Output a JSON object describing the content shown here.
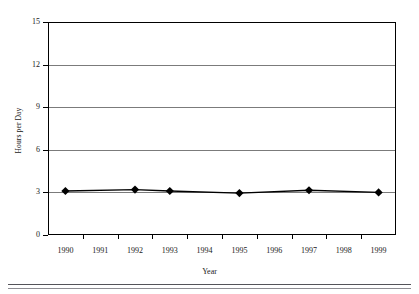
{
  "chart_data": {
    "type": "line",
    "title": "",
    "xlabel": "Year",
    "ylabel": "Hours per Day",
    "categories": [
      "1990",
      "1991",
      "1992",
      "1993",
      "1994",
      "1995",
      "1996",
      "1997",
      "1998",
      "1999"
    ],
    "x_tick_labels": [
      "1990",
      "1991",
      "1992",
      "1993",
      "1994",
      "1995",
      "1996",
      "1997",
      "1998",
      "1999"
    ],
    "y_tick_labels": [
      "0",
      "3",
      "6",
      "9",
      "12",
      "15"
    ],
    "y_ticks": [
      0,
      3,
      6,
      9,
      12,
      15
    ],
    "ylim": [
      0,
      15
    ],
    "grid": "horizontal",
    "legend": "none",
    "marker": "diamond",
    "marker_color": "#000000",
    "line_color": "#000000",
    "series": [
      {
        "name": "Hours per Day",
        "points": [
          {
            "x": "1990",
            "y": 3.1
          },
          {
            "x": "1992",
            "y": 3.2
          },
          {
            "x": "1993",
            "y": 3.1
          },
          {
            "x": "1995",
            "y": 2.95
          },
          {
            "x": "1997",
            "y": 3.15
          },
          {
            "x": "1999",
            "y": 3.0
          }
        ]
      }
    ]
  },
  "figure": {
    "y_axis_title": "Hours per Day",
    "x_axis_title": "Year"
  }
}
